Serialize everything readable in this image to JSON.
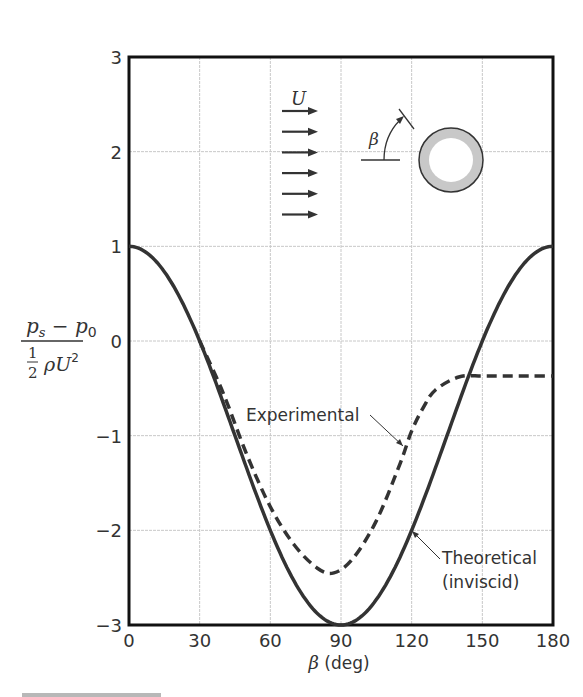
{
  "chart_data": {
    "type": "line",
    "title": "",
    "xlabel": "β (deg)",
    "ylabel": "(p_s − p_0) / (½ ρ U²)",
    "ylabel_parts": {
      "numerator": "p_s − p_0",
      "denominator": "½ ρU²"
    },
    "xlim": [
      0,
      180
    ],
    "ylim": [
      -3,
      3
    ],
    "x_ticks": [
      0,
      30,
      60,
      90,
      120,
      150,
      180
    ],
    "y_ticks": [
      -3,
      -2,
      -1,
      0,
      1,
      2,
      3
    ],
    "x_tick_labels": [
      "0",
      "30",
      "60",
      "90",
      "120",
      "150",
      "180"
    ],
    "y_tick_labels": [
      "−3",
      "−2",
      "−1",
      "0",
      "1",
      "2",
      "3"
    ],
    "grid": true,
    "series": [
      {
        "name": "Theoretical (inviscid)",
        "style": "solid",
        "formula": "1 - 4 sin^2(beta)",
        "x": [
          0,
          15,
          30,
          45,
          60,
          75,
          90,
          105,
          120,
          135,
          150,
          165,
          180
        ],
        "values": [
          1.0,
          0.73,
          0.0,
          -1.0,
          -2.0,
          -2.73,
          -3.0,
          -2.73,
          -2.0,
          -1.0,
          0.0,
          0.73,
          1.0
        ]
      },
      {
        "name": "Experimental",
        "style": "dashed",
        "x": [
          30,
          40,
          50,
          60,
          70,
          80,
          87,
          95,
          105,
          115,
          120,
          125,
          130,
          140,
          150,
          160,
          170,
          180
        ],
        "values": [
          0.0,
          -0.55,
          -1.2,
          -1.75,
          -2.15,
          -2.4,
          -2.45,
          -2.3,
          -1.9,
          -1.3,
          -0.95,
          -0.7,
          -0.52,
          -0.38,
          -0.37,
          -0.37,
          -0.37,
          -0.37
        ]
      }
    ],
    "annotations": [
      {
        "text": "Experimental",
        "points_to": {
          "x": 118,
          "y": -1.1
        }
      },
      {
        "text": "Theoretical",
        "text2": "(inviscid)",
        "points_to": {
          "x": 121,
          "y": -2.0
        }
      }
    ],
    "inset": {
      "flow_label": "U",
      "angle_label": "β",
      "arrow_count": 6,
      "cylinder_fill": "#c8c8c8"
    }
  },
  "colors": {
    "line": "#333333",
    "grid": "#c8c8c8",
    "frame": "#111111"
  }
}
